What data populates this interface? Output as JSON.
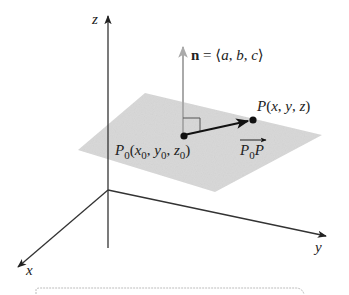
{
  "figure": {
    "axes": {
      "z_label": "z",
      "y_label": "y",
      "x_label": "x"
    },
    "normal": {
      "symbol": "n",
      "equals": " = ⟨",
      "a": "a",
      "sep1": ", ",
      "b": "b",
      "sep2": ", ",
      "c": "c",
      "close": "⟩"
    },
    "point_p": {
      "name": "P",
      "open": "(",
      "x": "x",
      "c1": ", ",
      "y": "y",
      "c2": ", ",
      "z": "z",
      "close": ")"
    },
    "point_p0": {
      "name": "P",
      "sub": "0",
      "open": "(",
      "x": "x",
      "xsub": "0",
      "c1": ", ",
      "y": "y",
      "ysub": "0",
      "c2": ", ",
      "z": "z",
      "zsub": "0",
      "close": ")"
    },
    "vector_label": {
      "p0": "P",
      "p0sub": "0",
      "p": "P"
    },
    "colors": {
      "plane": "#d9d9d9",
      "axis": "#333333",
      "normal_arrow": "#aaaaaa",
      "vector": "#111111"
    }
  }
}
